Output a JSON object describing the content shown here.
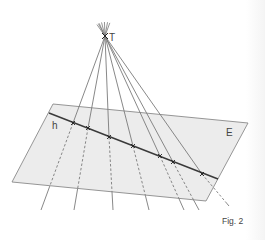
{
  "figure": {
    "caption": "Fig. 2",
    "labels": {
      "apex": "T",
      "line": "h",
      "plane": "E"
    },
    "colors": {
      "plane_fill": "#ececec",
      "plane_stroke": "#8a8a8a",
      "ray": "#7a7a7a",
      "line_h": "#3a3a3a",
      "text": "#444444"
    },
    "apex_point": [
      105,
      36
    ],
    "plane_corners": [
      [
        53,
        104
      ],
      [
        248,
        123
      ],
      [
        206,
        201
      ],
      [
        12,
        182
      ]
    ],
    "line_h": {
      "start": [
        49,
        113
      ],
      "end": [
        218,
        179
      ]
    },
    "intersection_points": [
      [
        73,
        123
      ],
      [
        88,
        128
      ],
      [
        109,
        137
      ],
      [
        133,
        146
      ],
      [
        160,
        156
      ],
      [
        173,
        162
      ],
      [
        202,
        174
      ]
    ],
    "ray_ends": [
      [
        41,
        210
      ],
      [
        74,
        210
      ],
      [
        113,
        210
      ],
      [
        149,
        210
      ],
      [
        184,
        210
      ],
      [
        199,
        210
      ],
      [
        229,
        206
      ]
    ]
  }
}
